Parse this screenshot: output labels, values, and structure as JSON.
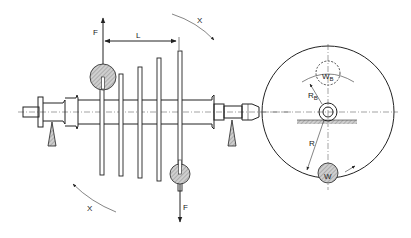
{
  "diagram": {
    "labels": {
      "force_top": "F",
      "force_bottom": "F",
      "length": "L",
      "rotation_top": "X",
      "rotation_bottom": "X",
      "balance_weight": "W",
      "balance_weight_sub": "B",
      "balance_radius": "R",
      "balance_radius_sub": "B",
      "radius": "R",
      "weight": "W"
    },
    "colors": {
      "ink": "#222222",
      "hatch_fill": "#cccccc",
      "background": "#ffffff"
    }
  }
}
